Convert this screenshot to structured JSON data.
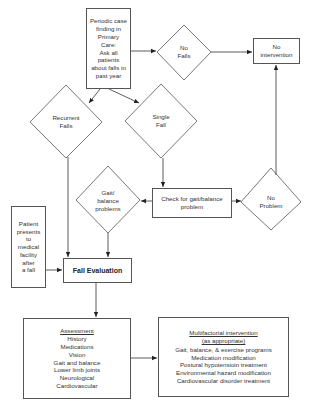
{
  "diagram": {
    "nodes": {
      "periodic": {
        "lines": [
          "Periodic case",
          "finding in",
          "Primary",
          "Care:",
          "Ask all",
          "patients",
          "about falls in",
          "past year"
        ]
      },
      "no_falls": {
        "lines": [
          "No",
          "Falls"
        ]
      },
      "no_intervention": {
        "lines": [
          "No",
          "intervention"
        ]
      },
      "recurrent_falls": {
        "lines": [
          "Recurrent",
          "Falls"
        ]
      },
      "single_fall": {
        "lines": [
          "Single",
          "Fall"
        ]
      },
      "gait_balance": {
        "lines": [
          "Gait/",
          "balance",
          "problems"
        ]
      },
      "check_gait": {
        "lines": [
          "Check for gait/balance",
          "problem"
        ]
      },
      "no_problem": {
        "lines": [
          "No",
          "Problem"
        ]
      },
      "patient_presents": {
        "lines": [
          "Patient",
          "presents",
          "to",
          "medical",
          "facility",
          "after",
          "a fall"
        ]
      },
      "fall_evaluation": {
        "label": "Fall Evaluation"
      },
      "assessment": {
        "title": "Assessment",
        "items": [
          "History",
          "Medications",
          "Vision",
          "Gait and balance",
          "Lower limb joints",
          "Neurological",
          "Cardiovascular"
        ]
      },
      "multifactorial": {
        "title_lines": [
          "Multifactorial intervention",
          "(as appropriate)"
        ],
        "items": [
          "Gait, balance, & exercise programs",
          "Medication modification",
          "Postural hypotensioin treatment",
          "Environmental hazard modification",
          "Cardiovascular disorder treatment"
        ]
      }
    },
    "edges": [
      {
        "from": "periodic",
        "to": "no_falls"
      },
      {
        "from": "no_falls",
        "to": "no_intervention"
      },
      {
        "from": "periodic",
        "to": "recurrent_falls"
      },
      {
        "from": "periodic",
        "to": "single_fall"
      },
      {
        "from": "single_fall",
        "to": "check_gait"
      },
      {
        "from": "check_gait",
        "to": "gait_balance"
      },
      {
        "from": "check_gait",
        "to": "no_problem"
      },
      {
        "from": "no_problem",
        "to": "no_intervention"
      },
      {
        "from": "recurrent_falls",
        "to": "fall_evaluation"
      },
      {
        "from": "gait_balance",
        "to": "fall_evaluation"
      },
      {
        "from": "patient_presents",
        "to": "fall_evaluation"
      },
      {
        "from": "fall_evaluation",
        "to": "assessment"
      },
      {
        "from": "assessment",
        "to": "multifactorial"
      }
    ],
    "colors": {
      "stroke": "#555555",
      "text": "#333333",
      "background": "#ffffff"
    }
  }
}
